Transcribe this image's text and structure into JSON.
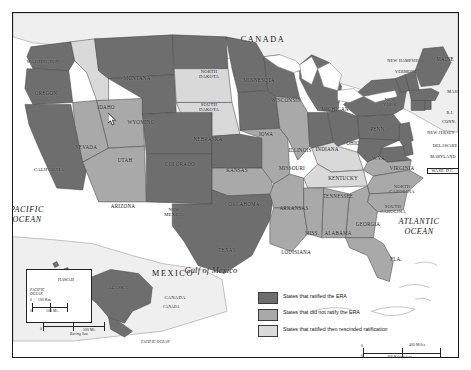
{
  "map": {
    "title": "Equal Rights Amendment (ERA) ratification status by state",
    "countries": [
      {
        "name": "CANADA",
        "x": 250,
        "y": 28
      },
      {
        "name": "MEXICO",
        "x": 160,
        "y": 262
      },
      {
        "name": "CANADA",
        "x": 162,
        "y": 288
      }
    ],
    "oceans": [
      {
        "name": "PACIFIC\nOCEAN",
        "x": 14,
        "y": 200
      },
      {
        "name": "ATLANTIC\nOCEAN",
        "x": 406,
        "y": 212
      },
      {
        "name": "Gulf of Mexico",
        "x": 198,
        "y": 262
      }
    ],
    "states": [
      {
        "code": "WA",
        "label": "WASHINGTON",
        "x": 30,
        "y": 50,
        "status": "ratified"
      },
      {
        "code": "OR",
        "label": "OREGON",
        "x": 33,
        "y": 81,
        "status": "ratified"
      },
      {
        "code": "ID",
        "label": "IDAHO",
        "x": 93,
        "y": 95,
        "status": "rescinded"
      },
      {
        "code": "MT",
        "label": "MONTANA",
        "x": 124,
        "y": 66,
        "status": "ratified"
      },
      {
        "code": "ND",
        "label": "NORTH\nDAKOTA",
        "x": 196,
        "y": 60,
        "status": "ratified"
      },
      {
        "code": "SD",
        "label": "SOUTH\nDAKOTA",
        "x": 196,
        "y": 93,
        "status": "rescinded"
      },
      {
        "code": "MN",
        "label": "MINNESOTA",
        "x": 246,
        "y": 68,
        "status": "ratified"
      },
      {
        "code": "WI",
        "label": "WISCONSIN",
        "x": 273,
        "y": 88,
        "status": "ratified"
      },
      {
        "code": "MI",
        "label": "MICHIGAN",
        "x": 322,
        "y": 97,
        "status": "ratified"
      },
      {
        "code": "WY",
        "label": "WYOMING",
        "x": 128,
        "y": 110,
        "status": "ratified"
      },
      {
        "code": "NE",
        "label": "NEBRASKA",
        "x": 195,
        "y": 127,
        "status": "rescinded"
      },
      {
        "code": "IA",
        "label": "IOWA",
        "x": 253,
        "y": 122,
        "status": "ratified"
      },
      {
        "code": "IL",
        "label": "ILLINOIS",
        "x": 287,
        "y": 138,
        "status": "not-ratified"
      },
      {
        "code": "IN",
        "label": "INDIANA",
        "x": 314,
        "y": 137,
        "status": "ratified"
      },
      {
        "code": "OH",
        "label": "OHIO",
        "x": 340,
        "y": 131,
        "status": "ratified"
      },
      {
        "code": "PA",
        "label": "PENN.",
        "x": 365,
        "y": 117,
        "status": "ratified"
      },
      {
        "code": "NY",
        "label": "NEW\nYORK",
        "x": 377,
        "y": 88,
        "status": "ratified"
      },
      {
        "code": "NH",
        "label": "NEW HAMPSHIRE",
        "x": 393,
        "y": 49,
        "status": "ratified"
      },
      {
        "code": "VT",
        "label": "VERMONT",
        "x": 393,
        "y": 60,
        "status": "ratified"
      },
      {
        "code": "ME",
        "label": "MAINE",
        "x": 432,
        "y": 47,
        "status": "ratified"
      },
      {
        "code": "MA",
        "label": "MASS.",
        "x": 441,
        "y": 80,
        "status": "ratified"
      },
      {
        "code": "RI",
        "label": "R.I.",
        "x": 437,
        "y": 101,
        "status": "ratified"
      },
      {
        "code": "CT",
        "label": "CONN.",
        "x": 436,
        "y": 110,
        "status": "ratified"
      },
      {
        "code": "NJ",
        "label": "NEW JERSEY",
        "x": 428,
        "y": 121,
        "status": "ratified"
      },
      {
        "code": "DE",
        "label": "DELAWARE",
        "x": 432,
        "y": 134,
        "status": "ratified"
      },
      {
        "code": "MD",
        "label": "MARYLAND",
        "x": 430,
        "y": 145,
        "status": "ratified"
      },
      {
        "code": "DC",
        "label": "WASH. D.C.",
        "x": 429,
        "y": 158,
        "status": "ratified"
      },
      {
        "code": "WV",
        "label": "W.VA.",
        "x": 366,
        "y": 146,
        "status": "ratified"
      },
      {
        "code": "VA",
        "label": "VIRGINIA",
        "x": 389,
        "y": 156,
        "status": "not-ratified"
      },
      {
        "code": "KY",
        "label": "KENTUCKY",
        "x": 330,
        "y": 166,
        "status": "rescinded"
      },
      {
        "code": "TN",
        "label": "TENNESSEE",
        "x": 325,
        "y": 184,
        "status": "rescinded"
      },
      {
        "code": "NC",
        "label": "NORTH\nCAROLINA",
        "x": 389,
        "y": 175,
        "status": "not-ratified"
      },
      {
        "code": "SC",
        "label": "SOUTH\nCAROLINA",
        "x": 380,
        "y": 195,
        "status": "not-ratified"
      },
      {
        "code": "GA",
        "label": "GEORGIA",
        "x": 355,
        "y": 212,
        "status": "not-ratified"
      },
      {
        "code": "AL",
        "label": "ALABAMA",
        "x": 325,
        "y": 221,
        "status": "not-ratified"
      },
      {
        "code": "MS",
        "label": "MISS.",
        "x": 299,
        "y": 221,
        "status": "not-ratified"
      },
      {
        "code": "FL",
        "label": "FLA.",
        "x": 383,
        "y": 247,
        "status": "not-ratified"
      },
      {
        "code": "LA",
        "label": "LOUISIANA",
        "x": 283,
        "y": 240,
        "status": "not-ratified"
      },
      {
        "code": "AR",
        "label": "ARKANSAS",
        "x": 281,
        "y": 196,
        "status": "not-ratified"
      },
      {
        "code": "MO",
        "label": "MISSOURI",
        "x": 279,
        "y": 156,
        "status": "not-ratified"
      },
      {
        "code": "KS",
        "label": "KANSAS",
        "x": 224,
        "y": 158,
        "status": "ratified"
      },
      {
        "code": "OK",
        "label": "OKLAHOMA",
        "x": 231,
        "y": 192,
        "status": "not-ratified"
      },
      {
        "code": "TX",
        "label": "TEXAS",
        "x": 214,
        "y": 238,
        "status": "ratified"
      },
      {
        "code": "CO",
        "label": "COLORADO",
        "x": 167,
        "y": 152,
        "status": "ratified"
      },
      {
        "code": "NM",
        "label": "NEW\nMEXICO",
        "x": 161,
        "y": 198,
        "status": "ratified"
      },
      {
        "code": "AZ",
        "label": "ARIZONA",
        "x": 110,
        "y": 194,
        "status": "not-ratified"
      },
      {
        "code": "UT",
        "label": "UTAH",
        "x": 112,
        "y": 148,
        "status": "not-ratified"
      },
      {
        "code": "NV",
        "label": "NEVADA",
        "x": 73,
        "y": 135,
        "status": "not-ratified"
      },
      {
        "code": "CA",
        "label": "CALIFORNIA",
        "x": 36,
        "y": 158,
        "status": "ratified"
      },
      {
        "code": "AK",
        "label": "ALASKA",
        "x": 108,
        "y": 288,
        "status": "ratified"
      },
      {
        "code": "HI",
        "label": "HAWAII",
        "x": 50,
        "y": 262,
        "status": "ratified"
      }
    ],
    "legend": {
      "items": [
        {
          "label": "States that ratified the ERA",
          "status": "ratified"
        },
        {
          "label": "States that did not ratify the ERA",
          "status": "not-ratified"
        },
        {
          "label": "States that ratified then\nrescinded ratification",
          "status": "rescinded"
        }
      ]
    },
    "colors": {
      "ratified": "#6e6e6e",
      "not_ratified": "#a9a9a9",
      "rescinded": "#d9d9d9",
      "water": "#ffffff",
      "foreign_land": "#efefef",
      "border": "#1a1a1a"
    },
    "scale_main": {
      "miles": "400 Miles",
      "km": "400 Kilometers",
      "zero_top": "0",
      "zero_bottom": "0"
    },
    "insets": {
      "hawaii": {
        "name": "HAWAII",
        "ocean": "PACIFIC\nOCEAN",
        "km": "100 Km.",
        "mi": "100 Mi.",
        "zero_km": "0",
        "zero_mi": "0"
      },
      "alaska": {
        "name": "ALASKA",
        "km": "500 Km.",
        "mi": "500 Mi.",
        "zero_km": "0",
        "zero_mi": "0",
        "sea": "Bering Sea",
        "ocean": "PACIFIC OCEAN",
        "ussr": "U.S.S.R.",
        "canada": "CANADA"
      }
    }
  }
}
